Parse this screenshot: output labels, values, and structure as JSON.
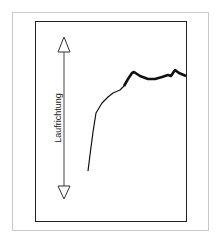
{
  "diagram": {
    "axis_label": "Laufrichtung",
    "arrow": "double-headed-vertical-arrow",
    "curve_description": "profile-curve",
    "colors": {
      "frame": "#c8c8c8",
      "box": "#222222",
      "curve": "#111111"
    }
  }
}
